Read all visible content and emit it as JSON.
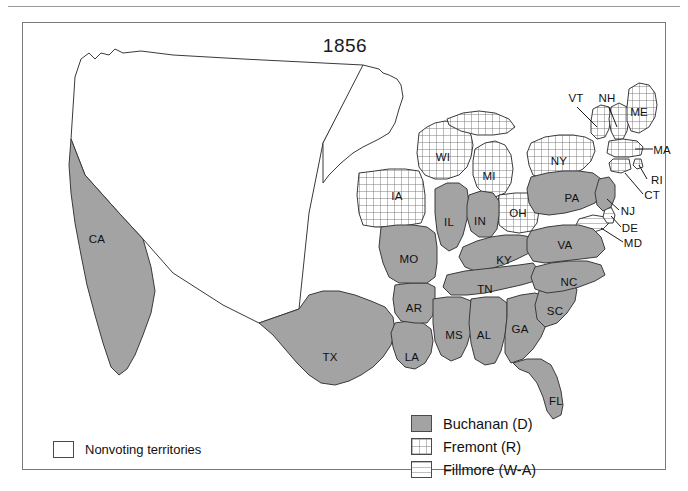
{
  "map": {
    "title": "1856",
    "colors": {
      "buchanan_fill": "#a3a3a3",
      "territory_fill": "#ffffff",
      "outline": "#3a3a3a",
      "frame": "#7a7a7a"
    },
    "legend_territories": {
      "swatch": "nonvoting-swatch",
      "label": "Nonvoting territories"
    },
    "legend_parties": [
      {
        "label": "Buchanan (D)",
        "pattern": "solid",
        "swatch": "buchanan-swatch"
      },
      {
        "label": "Fremont (R)",
        "pattern": "grid",
        "swatch": "fremont-swatch"
      },
      {
        "label": "Fillmore (W-A)",
        "pattern": "horizontal-lines",
        "swatch": "fillmore-swatch"
      }
    ],
    "state_labels": [
      {
        "code": "CA",
        "x": 74,
        "y": 216,
        "party": "Buchanan (D)"
      },
      {
        "code": "TX",
        "x": 307,
        "y": 334,
        "party": "Buchanan (D)"
      },
      {
        "code": "LA",
        "x": 389,
        "y": 334,
        "party": "Buchanan (D)"
      },
      {
        "code": "AR",
        "x": 391,
        "y": 285,
        "party": "Buchanan (D)"
      },
      {
        "code": "MO",
        "x": 386,
        "y": 236,
        "party": "Buchanan (D)"
      },
      {
        "code": "IL",
        "x": 426,
        "y": 199,
        "party": "Buchanan (D)"
      },
      {
        "code": "IN",
        "x": 457,
        "y": 198,
        "party": "Buchanan (D)"
      },
      {
        "code": "OH",
        "x": 495,
        "y": 190,
        "party": "Fremont (R)"
      },
      {
        "code": "MI",
        "x": 466,
        "y": 153,
        "party": "Fremont (R)"
      },
      {
        "code": "WI",
        "x": 420,
        "y": 134,
        "party": "Fremont (R)"
      },
      {
        "code": "IA",
        "x": 374,
        "y": 173,
        "party": "Fremont (R)"
      },
      {
        "code": "KY",
        "x": 481,
        "y": 237,
        "party": "Buchanan (D)"
      },
      {
        "code": "TN",
        "x": 462,
        "y": 266,
        "party": "Buchanan (D)"
      },
      {
        "code": "MS",
        "x": 431,
        "y": 312,
        "party": "Buchanan (D)"
      },
      {
        "code": "AL",
        "x": 461,
        "y": 312,
        "party": "Buchanan (D)"
      },
      {
        "code": "GA",
        "x": 497,
        "y": 306,
        "party": "Buchanan (D)"
      },
      {
        "code": "SC",
        "x": 532,
        "y": 288,
        "party": "Buchanan (D)"
      },
      {
        "code": "NC",
        "x": 546,
        "y": 259,
        "party": "Buchanan (D)"
      },
      {
        "code": "VA",
        "x": 542,
        "y": 222,
        "party": "Buchanan (D)"
      },
      {
        "code": "FL",
        "x": 533,
        "y": 378,
        "party": "Buchanan (D)"
      },
      {
        "code": "PA",
        "x": 549,
        "y": 175,
        "party": "Buchanan (D)"
      },
      {
        "code": "NY",
        "x": 536,
        "y": 138,
        "party": "Fremont (R)"
      },
      {
        "code": "ME",
        "x": 616,
        "y": 89,
        "party": "Fremont (R)"
      },
      {
        "code": "VT",
        "x": 553,
        "y": 75,
        "party": "Fremont (R)"
      },
      {
        "code": "NH",
        "x": 584,
        "y": 75,
        "party": "Fremont (R)"
      },
      {
        "code": "MA",
        "x": 639,
        "y": 127,
        "party": "Fremont (R)"
      },
      {
        "code": "RI",
        "x": 634,
        "y": 157,
        "party": "Fremont (R)"
      },
      {
        "code": "CT",
        "x": 629,
        "y": 172,
        "party": "Fremont (R)"
      },
      {
        "code": "NJ",
        "x": 605,
        "y": 188,
        "party": "Buchanan (D)"
      },
      {
        "code": "DE",
        "x": 607,
        "y": 205,
        "party": "Fillmore (W-A)"
      },
      {
        "code": "MD",
        "x": 610,
        "y": 220,
        "party": "Fillmore (W-A)"
      }
    ]
  }
}
